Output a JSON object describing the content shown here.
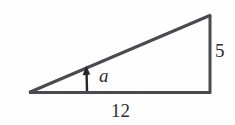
{
  "figure": {
    "background_color": "#fefefe",
    "stroke_color": "#4a4a50",
    "text_color": "#2e2e33"
  },
  "labels": {
    "vertical_side": "5",
    "horizontal_side": "12",
    "angle": "a"
  },
  "geometry": {
    "left_vertex": "(29, 93)",
    "right_angle_vertex": "(211, 93)",
    "apex_vertex": "(211, 15)",
    "arrow_tip": "(86, 66)",
    "arrow_base": "(88, 92)"
  }
}
